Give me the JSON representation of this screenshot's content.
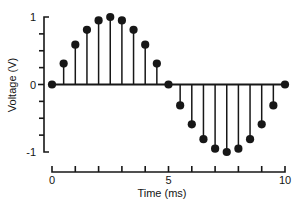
{
  "chart_data": {
    "type": "scatter",
    "plot_style": "stem",
    "title": "",
    "subtitle": "",
    "xlabel": "Time (ms)",
    "ylabel": "Voltage (V)",
    "xlim": [
      0,
      10
    ],
    "ylim": [
      -1,
      1
    ],
    "grid": false,
    "legend": null,
    "x_tick_labels": [
      "0",
      "5",
      "10"
    ],
    "x_tick_label_values": [
      0,
      5,
      10
    ],
    "x_major_ticks": [
      0,
      1,
      2,
      3,
      4,
      5,
      6,
      7,
      8,
      9,
      10
    ],
    "y_tick_labels": [
      "1",
      "0",
      "-1"
    ],
    "y_tick_label_values": [
      1,
      0,
      -1
    ],
    "y_major_ticks": [
      -1,
      -0.75,
      -0.5,
      -0.25,
      0,
      0.25,
      0.5,
      0.75,
      1
    ],
    "sample_interval_ms": 0.5,
    "x": [
      0,
      0.5,
      1,
      1.5,
      2,
      2.5,
      3,
      3.5,
      4,
      4.5,
      5,
      5.5,
      6,
      6.5,
      7,
      7.5,
      8,
      8.5,
      9,
      9.5,
      10
    ],
    "values": [
      0,
      0.31,
      0.59,
      0.81,
      0.95,
      1.0,
      0.95,
      0.81,
      0.59,
      0.31,
      0,
      -0.31,
      -0.59,
      -0.81,
      -0.95,
      -1.0,
      -0.95,
      -0.81,
      -0.59,
      -0.31,
      0
    ],
    "series": [
      {
        "name": "Voltage",
        "values": [
          0,
          0.31,
          0.59,
          0.81,
          0.95,
          1.0,
          0.95,
          0.81,
          0.59,
          0.31,
          0,
          -0.31,
          -0.59,
          -0.81,
          -0.95,
          -1.0,
          -0.95,
          -0.81,
          -0.59,
          -0.31,
          0
        ]
      }
    ],
    "marker_color": "#171717",
    "stem_color": "#171717",
    "baseline_value": 0
  },
  "axes": {
    "y_axis_title": "Voltage (V)",
    "x_axis_title": "Time (ms)"
  }
}
